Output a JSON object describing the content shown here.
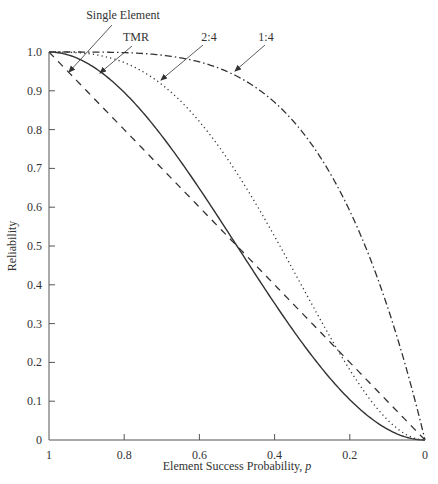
{
  "chart_data": {
    "type": "line",
    "title": "",
    "xlabel": "Element Success Probability, p",
    "ylabel": "Reliability",
    "xlim": [
      1,
      0
    ],
    "ylim": [
      0,
      1.0
    ],
    "x_reversed": true,
    "grid": false,
    "legend": "inline annotations with arrows",
    "x_ticks": [
      "1",
      "0.8",
      "0.6",
      "0.4",
      "0.2",
      "0"
    ],
    "y_ticks": [
      "0",
      "0.1",
      "0.2",
      "0.3",
      "0.4",
      "0.5",
      "0.6",
      "0.7",
      "0.8",
      "0.9",
      "1.0"
    ],
    "x": [
      1.0,
      0.9,
      0.8,
      0.7,
      0.6,
      0.5,
      0.4,
      0.3,
      0.2,
      0.1,
      0.0
    ],
    "series": [
      {
        "name": "Single Element",
        "style": "dashed",
        "formula": "p",
        "values": [
          1.0,
          0.9,
          0.8,
          0.7,
          0.6,
          0.5,
          0.4,
          0.3,
          0.2,
          0.1,
          0.0
        ]
      },
      {
        "name": "TMR",
        "style": "solid",
        "formula": "3p^2 - 2p^3",
        "values": [
          1.0,
          0.972,
          0.896,
          0.784,
          0.648,
          0.5,
          0.352,
          0.216,
          0.104,
          0.028,
          0.0
        ]
      },
      {
        "name": "2:4",
        "style": "dotted",
        "formula": "6p^2 - 8p^3 + 3p^4",
        "values": [
          1.0,
          0.996,
          0.973,
          0.916,
          0.821,
          0.688,
          0.525,
          0.348,
          0.181,
          0.052,
          0.0
        ]
      },
      {
        "name": "1:4",
        "style": "dash-dot",
        "formula": "1 - (1-p)^4",
        "values": [
          1.0,
          1.0,
          0.998,
          0.992,
          0.974,
          0.938,
          0.87,
          0.76,
          0.59,
          0.344,
          0.0
        ]
      }
    ],
    "annotations": [
      {
        "text": "Single Element",
        "points_to": "Single Element"
      },
      {
        "text": "TMR",
        "points_to": "TMR"
      },
      {
        "text": "2:4",
        "points_to": "2:4"
      },
      {
        "text": "1:4",
        "points_to": "1:4"
      }
    ]
  },
  "labels": {
    "xlabel_main": "Element Success Probability, ",
    "xlabel_var": "p",
    "ylabel": "Reliability",
    "annot_single": "Single Element",
    "annot_tmr": "TMR",
    "annot_24": "2:4",
    "annot_14": "1:4"
  },
  "colors": {
    "line": "#333333",
    "axis": "#555555"
  }
}
